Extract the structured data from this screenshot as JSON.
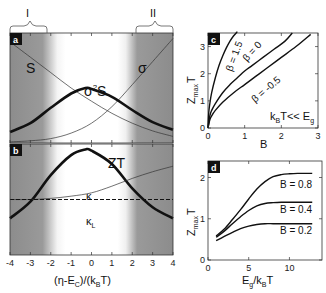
{
  "chart_data": [
    {
      "id": "a",
      "type": "line",
      "panel_label": "a",
      "xlim": [
        -4,
        4
      ],
      "region_brackets": [
        {
          "label": "I",
          "x_range": [
            -4,
            -2.2
          ]
        },
        {
          "label": "II",
          "x_range": [
            2.2,
            4
          ]
        }
      ],
      "series": [
        {
          "name": "S",
          "label": "S",
          "weight": "thin",
          "x": [
            -4,
            -3,
            -2,
            -1,
            0,
            1,
            2,
            3,
            4
          ],
          "y": [
            0.92,
            0.78,
            0.64,
            0.5,
            0.38,
            0.27,
            0.18,
            0.11,
            0.06
          ]
        },
        {
          "name": "sigma",
          "label": "σ",
          "weight": "thin",
          "x": [
            -4,
            -3,
            -2,
            -1,
            0,
            1,
            2,
            3,
            4
          ],
          "y": [
            0.01,
            0.02,
            0.04,
            0.09,
            0.18,
            0.33,
            0.53,
            0.74,
            0.95
          ]
        },
        {
          "name": "sigma2S",
          "label": "σ²S",
          "weight": "thick",
          "x": [
            -4,
            -3,
            -2,
            -1,
            -0.3,
            0,
            1,
            2,
            3,
            4
          ],
          "y": [
            0.1,
            0.18,
            0.32,
            0.45,
            0.5,
            0.49,
            0.42,
            0.3,
            0.19,
            0.12
          ]
        }
      ]
    },
    {
      "id": "b",
      "type": "line",
      "panel_label": "b",
      "xlim": [
        -4,
        4
      ],
      "xticks": [
        -4,
        -3,
        -2,
        -1,
        0,
        1,
        2,
        3,
        4
      ],
      "xlabel": "(η-E_C)/(k_BT)",
      "series": [
        {
          "name": "ZT",
          "label": "ZT",
          "weight": "thick",
          "x": [
            -4,
            -3,
            -2,
            -1,
            -0.3,
            0,
            1,
            2,
            3,
            4
          ],
          "y": [
            0.33,
            0.48,
            0.72,
            0.9,
            0.95,
            0.94,
            0.82,
            0.6,
            0.43,
            0.33
          ]
        },
        {
          "name": "kappa",
          "label": "κ",
          "weight": "thin",
          "x": [
            -4,
            -3,
            -2,
            -1,
            0,
            1,
            2,
            3,
            4
          ],
          "y": [
            0.5,
            0.5,
            0.51,
            0.53,
            0.56,
            0.62,
            0.69,
            0.75,
            0.8
          ]
        },
        {
          "name": "kappa_L",
          "label": "κ_L",
          "weight": "dashed",
          "x": [
            -4,
            4
          ],
          "y": [
            0.5,
            0.5
          ]
        }
      ]
    },
    {
      "id": "c",
      "type": "line",
      "panel_label": "c",
      "xlim": [
        0,
        3
      ],
      "ylim": [
        0,
        3.5
      ],
      "xticks": [
        0,
        1,
        2,
        3
      ],
      "yticks": [
        0,
        1,
        2,
        3
      ],
      "xlabel": "B",
      "ylabel": "Z_max T",
      "annotation": "k_BT << E_g",
      "series": [
        {
          "name": "beta=1.5",
          "label": "β = 1.5",
          "x": [
            0,
            0.02,
            0.05,
            0.1,
            0.2,
            0.3,
            0.4,
            0.5,
            0.6,
            0.7,
            0.8
          ],
          "y": [
            0,
            0.55,
            0.9,
            1.3,
            1.85,
            2.3,
            2.65,
            2.95,
            3.2,
            3.4,
            3.55
          ]
        },
        {
          "name": "beta=0",
          "label": "β = 0",
          "x": [
            0,
            0.05,
            0.1,
            0.2,
            0.4,
            0.6,
            0.8,
            1.0,
            1.2,
            1.5,
            1.8,
            2.1,
            2.3
          ],
          "y": [
            0,
            0.45,
            0.65,
            0.9,
            1.3,
            1.6,
            1.85,
            2.1,
            2.3,
            2.6,
            2.9,
            3.2,
            3.5
          ]
        },
        {
          "name": "beta=-0.5",
          "label": "β = -0.5",
          "x": [
            0,
            0.05,
            0.1,
            0.2,
            0.4,
            0.7,
            1.0,
            1.3,
            1.6,
            2.0,
            2.4,
            2.8
          ],
          "y": [
            0,
            0.3,
            0.45,
            0.65,
            0.95,
            1.3,
            1.6,
            1.9,
            2.2,
            2.6,
            3.0,
            3.45
          ]
        }
      ]
    },
    {
      "id": "d",
      "type": "line",
      "panel_label": "d",
      "xlim": [
        0,
        14
      ],
      "ylim": [
        0,
        2.4
      ],
      "xticks": [
        0,
        5,
        10
      ],
      "yticks": [
        0,
        1,
        2
      ],
      "xlabel": "E_g/k_BT",
      "ylabel": "Z_max T",
      "series": [
        {
          "name": "B=0.8",
          "label": "B = 0.8",
          "x": [
            1,
            2,
            3,
            4,
            5,
            6,
            7,
            8,
            9,
            10,
            11,
            12,
            12.8
          ],
          "y": [
            0.58,
            0.75,
            0.98,
            1.22,
            1.48,
            1.72,
            1.9,
            2.02,
            2.07,
            2.09,
            2.1,
            2.1,
            2.1
          ]
        },
        {
          "name": "B=0.4",
          "label": "B = 0.4",
          "x": [
            1,
            2,
            3,
            4,
            5,
            6,
            7,
            8,
            9,
            10,
            11,
            12,
            12.8
          ],
          "y": [
            0.55,
            0.7,
            0.88,
            1.05,
            1.2,
            1.31,
            1.37,
            1.39,
            1.4,
            1.4,
            1.4,
            1.4,
            1.4
          ]
        },
        {
          "name": "B=0.2",
          "label": "B = 0.2",
          "x": [
            1,
            2,
            3,
            4,
            5,
            6,
            7,
            8,
            9,
            10,
            11,
            12,
            12.8
          ],
          "y": [
            0.47,
            0.57,
            0.67,
            0.76,
            0.82,
            0.86,
            0.88,
            0.88,
            0.88,
            0.88,
            0.88,
            0.88,
            0.88
          ]
        }
      ]
    }
  ],
  "labels": {
    "bracket_I": "I",
    "bracket_II": "II",
    "panel_a": "a",
    "panel_b": "b",
    "panel_c": "c",
    "panel_d": "d",
    "S": "S",
    "sigma": "σ",
    "sigma2S_base": "σ",
    "sigma2S_sup": "2",
    "sigma2S_tail": "S",
    "ZT": "ZT",
    "kappa": "κ",
    "kappaL_base": "κ",
    "kappaL_sub": "L",
    "xlabel_b_1": "(η-E",
    "xlabel_b_sub1": "C",
    "xlabel_b_2": ")/(k",
    "xlabel_b_sub2": "B",
    "xlabel_b_3": "T)",
    "zmax_Z": "Z",
    "zmax_sub": "max",
    "zmax_T": "T",
    "c_xlabel": "B",
    "c_ann_k": "k",
    "c_ann_sub1": "B",
    "c_ann_mid": "T<< E",
    "c_ann_sub2": "g",
    "beta15": "β = 1.5",
    "beta0": "β = 0",
    "betam05": "β = -0.5",
    "d_xl_E": "E",
    "d_xl_sub1": "g",
    "d_xl_mid": "/k",
    "d_xl_sub2": "B",
    "d_xl_T": "T",
    "B08": "B = 0.8",
    "B04": "B = 0.4",
    "B02": "B = 0.2"
  }
}
